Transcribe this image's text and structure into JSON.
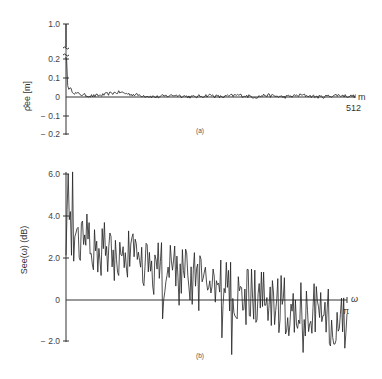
{
  "chart_data": [
    {
      "id": "a",
      "type": "line",
      "panel_label": "(a)",
      "title": "",
      "xlabel": "m",
      "ylabel": "ρ̂ee [m]",
      "x_end_label": "512",
      "xlim": [
        0,
        512
      ],
      "ylim": [
        -0.2,
        1.0
      ],
      "y_break": [
        0.25,
        0.95
      ],
      "yticks": [
        {
          "value": 1.0,
          "label": "1.0"
        },
        {
          "value": 0.2,
          "label": "0.2"
        },
        {
          "value": 0.1,
          "label": "0.1"
        },
        {
          "value": 0,
          "label": "0"
        },
        {
          "value": -0.1,
          "label": "− 0.1"
        },
        {
          "value": -0.2,
          "label": "− 0.2"
        }
      ],
      "grid": false,
      "series": [
        {
          "name": "estimated autocorrelation",
          "description": "Starts at 1.0 at m=0, drops to ~0.05 quickly, then fluctuates near 0 (roughly -0.01 to 0.03) out to m=512",
          "x": [
            0,
            1,
            2,
            4,
            8,
            12,
            16,
            24,
            32,
            48,
            64,
            80,
            96,
            112,
            128,
            144,
            160,
            176,
            192,
            208,
            224,
            240,
            256,
            272,
            288,
            304,
            320,
            336,
            352,
            368,
            384,
            400,
            416,
            432,
            448,
            464,
            480,
            496,
            512
          ],
          "values": [
            1.0,
            0.2,
            0.07,
            0.05,
            0.04,
            0.03,
            0.02,
            0.015,
            0.01,
            0.005,
            0.01,
            0.02,
            0.025,
            0.015,
            0.01,
            0.005,
            0.0,
            0.005,
            0.01,
            0.005,
            0.0,
            0.005,
            0.01,
            0.0,
            0.005,
            0.01,
            0.005,
            0.0,
            0.01,
            0.005,
            0.0,
            0.005,
            0.01,
            0.005,
            0.0,
            0.005,
            0.01,
            0.005,
            0.005
          ]
        }
      ]
    },
    {
      "id": "b",
      "type": "line",
      "panel_label": "(b)",
      "title": "",
      "xlabel": "ω",
      "x_end_label": "π",
      "ylabel": "See(ω)   (dB)",
      "xlim": [
        0,
        3.1416
      ],
      "ylim": [
        -2.5,
        6.0
      ],
      "yticks": [
        {
          "value": 6.0,
          "label": "6.0"
        },
        {
          "value": 4.0,
          "label": "4.0"
        },
        {
          "value": 2.0,
          "label": "2.0"
        },
        {
          "value": 0,
          "label": "0"
        },
        {
          "value": -2.0,
          "label": "− 2.0"
        }
      ],
      "grid": false,
      "series": [
        {
          "name": "log periodogram",
          "description": "Noisy spectrum in dB, peaks near 6 dB at low frequency, decaying trend to around -1 dB at ω=π",
          "trend_start_db": 3.5,
          "trend_end_db": -1.0,
          "peaks": [
            {
              "omega": 0.02,
              "db": 6.0
            },
            {
              "omega": 0.07,
              "db": 6.1
            },
            {
              "omega": 0.12,
              "db": 3.4
            },
            {
              "omega": 0.25,
              "db": 2.9
            },
            {
              "omega": 0.9,
              "db": 2.7
            },
            {
              "omega": 1.2,
              "db": 1.9
            }
          ],
          "troughs": [
            {
              "omega": 1.08,
              "db": -0.9
            },
            {
              "omega": 1.74,
              "db": -1.8
            },
            {
              "omega": 1.85,
              "db": -2.6
            },
            {
              "omega": 2.65,
              "db": -2.5
            },
            {
              "omega": 3.0,
              "db": -2.1
            }
          ],
          "n_points": 256,
          "noise_amplitude_db": 1.0
        }
      ]
    }
  ]
}
